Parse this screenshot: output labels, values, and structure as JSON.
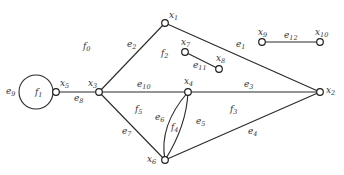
{
  "diagram": {
    "type": "planar graph with vertices, edges, and faces",
    "colors": {
      "background": "#ffffff",
      "stroke": "#2a2a2a",
      "text": "#333333"
    },
    "nodes": [
      {
        "id": "x1",
        "base": "x",
        "sub": "1",
        "x": 165,
        "y": 23,
        "lx": 169,
        "ly": 18
      },
      {
        "id": "x2",
        "base": "x",
        "sub": "2",
        "x": 320,
        "y": 92,
        "lx": 326,
        "ly": 93
      },
      {
        "id": "x3",
        "base": "x",
        "sub": "3",
        "x": 99,
        "y": 92,
        "lx": 88,
        "ly": 86
      },
      {
        "id": "x4",
        "base": "x",
        "sub": "4",
        "x": 188,
        "y": 92,
        "lx": 184,
        "ly": 84
      },
      {
        "id": "x5",
        "base": "x",
        "sub": "5",
        "x": 56,
        "y": 92,
        "lx": 60,
        "ly": 86
      },
      {
        "id": "x6",
        "base": "x",
        "sub": "6",
        "x": 165,
        "y": 160,
        "lx": 147,
        "ly": 162
      },
      {
        "id": "x7",
        "base": "x",
        "sub": "7",
        "x": 185,
        "y": 52,
        "lx": 181,
        "ly": 45
      },
      {
        "id": "x8",
        "base": "x",
        "sub": "8",
        "x": 219,
        "y": 69,
        "lx": 216,
        "ly": 61
      },
      {
        "id": "x9",
        "base": "x",
        "sub": "9",
        "x": 262,
        "y": 42,
        "lx": 258,
        "ly": 35
      },
      {
        "id": "x10",
        "base": "x",
        "sub": "10",
        "x": 320,
        "y": 42,
        "lx": 315,
        "ly": 35
      }
    ],
    "edges": [
      {
        "id": "e1",
        "base": "e",
        "sub": "1",
        "from": "x1",
        "to": "x2",
        "lx": 236,
        "ly": 47
      },
      {
        "id": "e2",
        "base": "e",
        "sub": "2",
        "from": "x3",
        "to": "x1",
        "lx": 127,
        "ly": 47
      },
      {
        "id": "e3",
        "base": "e",
        "sub": "3",
        "from": "x4",
        "to": "x2",
        "lx": 244,
        "ly": 87
      },
      {
        "id": "e4",
        "base": "e",
        "sub": "4",
        "from": "x6",
        "to": "x2",
        "lx": 248,
        "ly": 134
      },
      {
        "id": "e5",
        "base": "e",
        "sub": "5",
        "from": "x4",
        "to": "x6",
        "curve": "right",
        "lx": 196,
        "ly": 124
      },
      {
        "id": "e6",
        "base": "e",
        "sub": "6",
        "from": "x4",
        "to": "x6",
        "curve": "left",
        "lx": 155,
        "ly": 120
      },
      {
        "id": "e7",
        "base": "e",
        "sub": "7",
        "from": "x3",
        "to": "x6",
        "lx": 122,
        "ly": 134
      },
      {
        "id": "e8",
        "base": "e",
        "sub": "8",
        "from": "x5",
        "to": "x3",
        "lx": 74,
        "ly": 101
      },
      {
        "id": "e9",
        "base": "e",
        "sub": "9",
        "from": "x5",
        "to": "x5",
        "loop": true,
        "lx": 6,
        "ly": 94
      },
      {
        "id": "e10",
        "base": "e",
        "sub": "10",
        "from": "x3",
        "to": "x4",
        "lx": 137,
        "ly": 87
      },
      {
        "id": "e11",
        "base": "e",
        "sub": "11",
        "from": "x7",
        "to": "x8",
        "lx": 193,
        "ly": 68
      },
      {
        "id": "e12",
        "base": "e",
        "sub": "12",
        "from": "x9",
        "to": "x10",
        "lx": 284,
        "ly": 38
      }
    ],
    "faces": [
      {
        "id": "f0",
        "base": "f",
        "sub": "0",
        "lx": 83,
        "ly": 49
      },
      {
        "id": "f1",
        "base": "f",
        "sub": "1",
        "lx": 35,
        "ly": 95
      },
      {
        "id": "f2",
        "base": "f",
        "sub": "2",
        "lx": 161,
        "ly": 56
      },
      {
        "id": "f3",
        "base": "f",
        "sub": "3",
        "lx": 230,
        "ly": 112
      },
      {
        "id": "f4",
        "base": "f",
        "sub": "4",
        "lx": 171,
        "ly": 130
      },
      {
        "id": "f5",
        "base": "f",
        "sub": "5",
        "lx": 135,
        "ly": 112
      }
    ]
  }
}
